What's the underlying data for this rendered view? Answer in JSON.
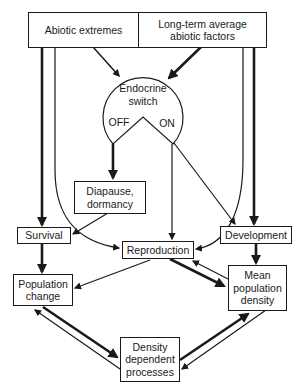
{
  "diagram": {
    "nodes": {
      "abiotic_extremes": "Abiotic extremes",
      "long_term_average": "Long-term average\nabiotic factors",
      "endocrine_switch": "Endocrine\nswitch",
      "switch_off": "OFF",
      "switch_on": "ON",
      "diapause": "Diapause,\ndormancy",
      "survival": "Survival",
      "reproduction": "Reproduction",
      "development": "Development",
      "population_change": "Population\nchange",
      "mean_population_density": "Mean\npopulation\ndensity",
      "density_dependent": "Density\ndependent\nprocesses"
    },
    "edges": [
      {
        "from": "Abiotic extremes",
        "to": "Endocrine switch",
        "weight": "medium"
      },
      {
        "from": "Long-term average abiotic factors",
        "to": "Endocrine switch",
        "weight": "thick"
      },
      {
        "from": "Abiotic extremes",
        "to": "Survival",
        "weight": "thick"
      },
      {
        "from": "Abiotic extremes",
        "to": "Reproduction",
        "weight": "thin"
      },
      {
        "from": "Long-term average abiotic factors",
        "to": "Development",
        "weight": "thick"
      },
      {
        "from": "Long-term average abiotic factors",
        "to": "Reproduction",
        "weight": "thin"
      },
      {
        "from": "Endocrine switch OFF",
        "to": "Diapause, dormancy",
        "weight": "thick"
      },
      {
        "from": "Endocrine switch ON",
        "to": "Reproduction",
        "weight": "thin"
      },
      {
        "from": "Endocrine switch ON",
        "to": "Development",
        "weight": "thin"
      },
      {
        "from": "Diapause, dormancy",
        "to": "Survival",
        "weight": "thin"
      },
      {
        "from": "Survival",
        "to": "Population change",
        "weight": "thick"
      },
      {
        "from": "Reproduction",
        "to": "Population change",
        "weight": "thin"
      },
      {
        "from": "Reproduction",
        "to": "Mean population density",
        "weight": "thick"
      },
      {
        "from": "Mean population density",
        "to": "Reproduction",
        "weight": "thin"
      },
      {
        "from": "Development",
        "to": "Mean population density",
        "weight": "thick"
      },
      {
        "from": "Population change",
        "to": "Density dependent processes",
        "weight": "thick"
      },
      {
        "from": "Density dependent processes",
        "to": "Population change",
        "weight": "thin"
      },
      {
        "from": "Density dependent processes",
        "to": "Mean population density",
        "weight": "thick"
      },
      {
        "from": "Mean population density",
        "to": "Density dependent processes",
        "weight": "thin"
      }
    ]
  }
}
